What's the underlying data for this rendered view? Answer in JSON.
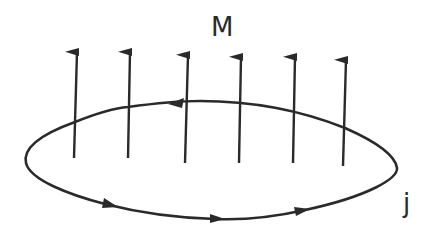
{
  "diagram": {
    "labels": {
      "magnetization": "M",
      "current": "j"
    },
    "stroke_color": "#2a2a2a",
    "background": "#ffffff",
    "arrows": [
      {
        "x1": 74,
        "y1": 158,
        "x2": 77,
        "y2": 52
      },
      {
        "x1": 128,
        "y1": 158,
        "x2": 130,
        "y2": 52
      },
      {
        "x1": 185,
        "y1": 163,
        "x2": 188,
        "y2": 55
      },
      {
        "x1": 239,
        "y1": 163,
        "x2": 241,
        "y2": 57
      },
      {
        "x1": 293,
        "y1": 163,
        "x2": 295,
        "y2": 57
      },
      {
        "x1": 343,
        "y1": 166,
        "x2": 346,
        "y2": 60
      }
    ],
    "loop_direction_markers": [
      "top-left-pointing",
      "bottom-right-pointing",
      "bottom-right-pointing",
      "bottom-right-pointing"
    ]
  }
}
